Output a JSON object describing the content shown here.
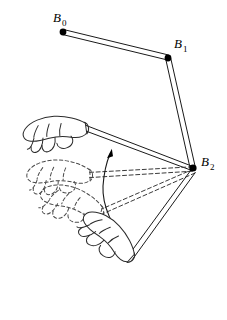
{
  "figure": {
    "background_color": "#ffffff",
    "ink_color": "#1a1a1a",
    "dashed_ink_color": "#4a4a4a",
    "width": 227,
    "height": 320
  },
  "joints": [
    {
      "id": "B0",
      "label": "B",
      "subscript": "0",
      "x": 63,
      "y": 32,
      "label_x": 53,
      "label_y": 22,
      "dot_radius": 3.4
    },
    {
      "id": "B1",
      "label": "B",
      "subscript": "1",
      "x": 168,
      "y": 58,
      "label_x": 174,
      "label_y": 48,
      "dot_radius": 3.4
    },
    {
      "id": "B2",
      "label": "B",
      "subscript": "2",
      "x": 193,
      "y": 168,
      "label_x": 201,
      "label_y": 166,
      "dot_radius": 3.6
    }
  ],
  "bones": [
    {
      "name": "bone-b0-b1",
      "from": "B0",
      "to": "B1",
      "style": "solid",
      "x1": 63,
      "y1": 32,
      "x2": 168,
      "y2": 58
    },
    {
      "name": "bone-b1-b2",
      "from": "B1",
      "to": "B2",
      "style": "solid",
      "x1": 168,
      "y1": 58,
      "x2": 193,
      "y2": 168
    },
    {
      "name": "bone-b2-hand-pose-1",
      "from": "B2",
      "to": "hand-pose-1",
      "style": "solid",
      "x1": 193,
      "y1": 168,
      "x2": 86,
      "y2": 128
    },
    {
      "name": "bone-b2-hand-pose-2",
      "from": "B2",
      "to": "hand-pose-2",
      "style": "dashed",
      "x1": 193,
      "y1": 168,
      "x2": 90,
      "y2": 175
    },
    {
      "name": "bone-b2-hand-pose-3",
      "from": "B2",
      "to": "hand-pose-3",
      "style": "dashed",
      "x1": 193,
      "y1": 168,
      "x2": 101,
      "y2": 212
    },
    {
      "name": "bone-b2-hand-pose-4",
      "from": "B2",
      "to": "hand-pose-4",
      "style": "solid",
      "x1": 193,
      "y1": 168,
      "x2": 131,
      "y2": 258
    }
  ],
  "hands": [
    {
      "name": "hand-pose-1",
      "style": "solid",
      "description": "end-effector hand, uppermost pose",
      "wrist_x": 86,
      "wrist_y": 128,
      "rotation_deg": -8
    },
    {
      "name": "hand-pose-2",
      "style": "dashed",
      "description": "interpolated hand pose, upper middle",
      "wrist_x": 90,
      "wrist_y": 175,
      "rotation_deg": -2
    },
    {
      "name": "hand-pose-3",
      "style": "dashed",
      "description": "interpolated hand pose, lower middle",
      "wrist_x": 101,
      "wrist_y": 212,
      "rotation_deg": 16
    },
    {
      "name": "hand-pose-4",
      "style": "solid",
      "description": "end-effector hand, lowermost pose",
      "wrist_x": 131,
      "wrist_y": 258,
      "rotation_deg": 42
    }
  ],
  "rotation_arrow": {
    "name": "rotation-arrow",
    "direction": "counter-clockwise",
    "arc_start_x": 126,
    "arc_start_y": 242,
    "arc_end_x": 109,
    "arc_end_y": 155,
    "arrow_tip_x": 111,
    "arrow_tip_y": 150
  }
}
